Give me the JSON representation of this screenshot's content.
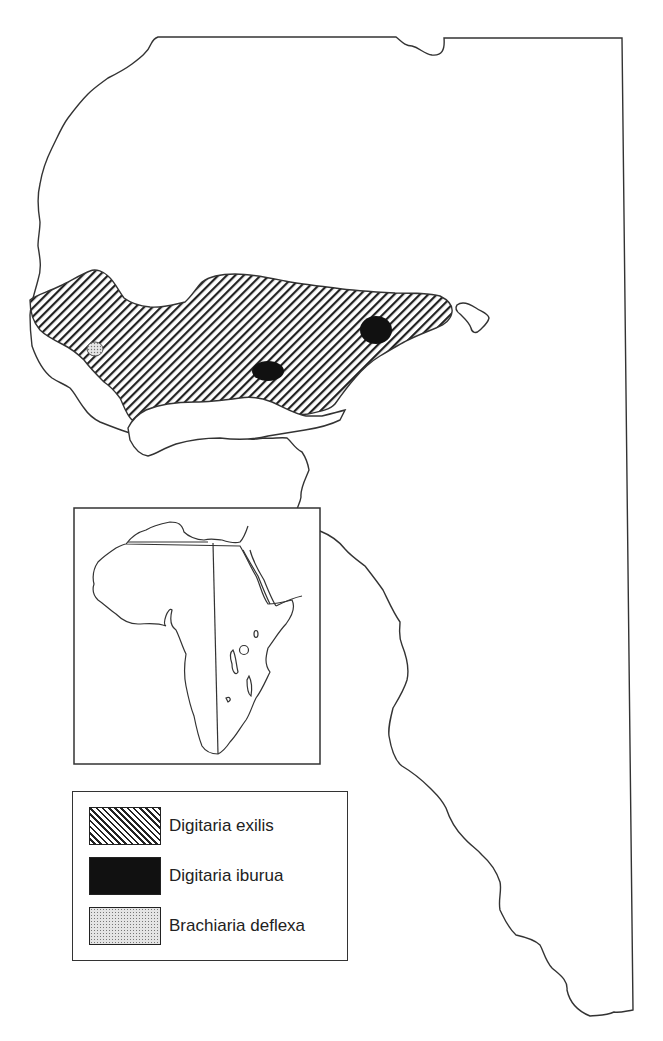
{
  "map": {
    "type": "species distribution map",
    "region": "West Africa",
    "colors": {
      "outline": "#333333",
      "hatch": "#222222",
      "solid": "#111111",
      "stipple": "#bbbbbb",
      "background": "#ffffff"
    },
    "features": {
      "main_region": "hatched band across West Africa (Digitaria exilis)",
      "solid_spots": 2,
      "stippled_spots": 1,
      "island_outline": 1
    }
  },
  "inset": {
    "description": "Outline map of Africa with a vertical line and western region marked"
  },
  "legend": {
    "items": [
      {
        "pattern": "diagonal-hatch",
        "label": "Digitaria exilis"
      },
      {
        "pattern": "solid-black",
        "label": "Digitaria iburua"
      },
      {
        "pattern": "stipple",
        "label": "Brachiaria deflexa"
      }
    ]
  }
}
